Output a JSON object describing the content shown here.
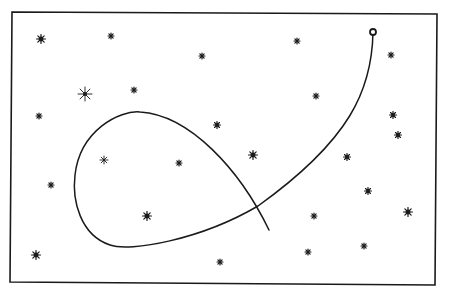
{
  "diagram": {
    "type": "star-field-with-trajectory",
    "background": "#ffffff",
    "ink": "#1a1a1a",
    "frame": {
      "points": [
        [
          12,
          12
        ],
        [
          437,
          14
        ],
        [
          435,
          285
        ],
        [
          10,
          282
        ]
      ],
      "stroke_width": 1.6
    },
    "trajectory": {
      "start_marker": {
        "x": 373,
        "y": 32,
        "r": 3,
        "style": "open-circle"
      },
      "path": "M373,32 C372,90 350,140 258,206 C200,240 130,252 110,245 C80,235 72,200 75,175 C80,130 120,110 140,112 C190,115 240,170 269,230",
      "stroke_width": 1.5
    },
    "stars": [
      {
        "x": 41,
        "y": 39,
        "size": 4.5,
        "kind": "filled"
      },
      {
        "x": 111,
        "y": 36,
        "size": 3,
        "kind": "small"
      },
      {
        "x": 202,
        "y": 56,
        "size": 3,
        "kind": "small"
      },
      {
        "x": 297,
        "y": 41,
        "size": 3,
        "kind": "small"
      },
      {
        "x": 391,
        "y": 55,
        "size": 3,
        "kind": "small"
      },
      {
        "x": 85,
        "y": 94,
        "size": 7,
        "kind": "spiky"
      },
      {
        "x": 134,
        "y": 90,
        "size": 3,
        "kind": "small"
      },
      {
        "x": 316,
        "y": 96,
        "size": 3,
        "kind": "small"
      },
      {
        "x": 39,
        "y": 116,
        "size": 3,
        "kind": "small"
      },
      {
        "x": 217,
        "y": 125,
        "size": 3.5,
        "kind": "filled"
      },
      {
        "x": 393,
        "y": 115,
        "size": 3.5,
        "kind": "filled"
      },
      {
        "x": 398,
        "y": 135,
        "size": 3.5,
        "kind": "filled"
      },
      {
        "x": 253,
        "y": 155,
        "size": 4.5,
        "kind": "filled"
      },
      {
        "x": 104,
        "y": 160,
        "size": 4,
        "kind": "spiky"
      },
      {
        "x": 179,
        "y": 163,
        "size": 3,
        "kind": "small"
      },
      {
        "x": 347,
        "y": 157,
        "size": 3.5,
        "kind": "filled"
      },
      {
        "x": 51,
        "y": 185,
        "size": 3,
        "kind": "small"
      },
      {
        "x": 368,
        "y": 191,
        "size": 3.5,
        "kind": "filled"
      },
      {
        "x": 147,
        "y": 216,
        "size": 4.5,
        "kind": "filled"
      },
      {
        "x": 314,
        "y": 216,
        "size": 3,
        "kind": "small"
      },
      {
        "x": 408,
        "y": 212,
        "size": 4.5,
        "kind": "filled"
      },
      {
        "x": 36,
        "y": 255,
        "size": 4.5,
        "kind": "filled"
      },
      {
        "x": 308,
        "y": 252,
        "size": 3,
        "kind": "small"
      },
      {
        "x": 364,
        "y": 246,
        "size": 3,
        "kind": "small"
      },
      {
        "x": 220,
        "y": 262,
        "size": 3,
        "kind": "small"
      }
    ]
  }
}
